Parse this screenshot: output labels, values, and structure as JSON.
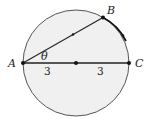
{
  "diagram": {
    "type": "circle-geometry",
    "colors": {
      "fill": "#f0f0f0",
      "stroke": "#555555",
      "line": "#222222",
      "point": "#111111"
    },
    "points": {
      "A": {
        "label": "A"
      },
      "B": {
        "label": "B"
      },
      "C": {
        "label": "C"
      }
    },
    "angle_label": "θ",
    "segment_labels": [
      "3",
      "3"
    ]
  }
}
